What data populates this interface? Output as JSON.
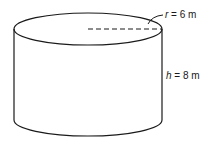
{
  "diagram": {
    "type": "cylinder",
    "radius_label": {
      "var": "r",
      "eq": " = ",
      "value": "6 m"
    },
    "height_label": {
      "var": "h",
      "eq": " = ",
      "value": "8 m"
    },
    "colors": {
      "stroke": "#1a1a1a",
      "background": "#ffffff"
    }
  }
}
